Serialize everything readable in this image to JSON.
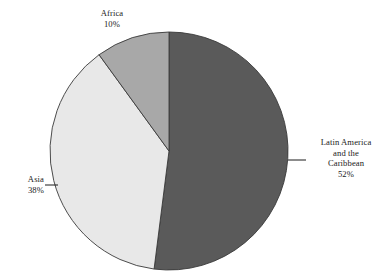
{
  "figure": {
    "background_color": "#ffffff",
    "width": 384,
    "height": 277
  },
  "chart_data": {
    "type": "pie",
    "title": "",
    "subtitle": "",
    "xlabel": "",
    "ylabel": "",
    "legend_position": "none",
    "grid": false,
    "start_angle_deg": 90,
    "direction": "clockwise",
    "units": "percent",
    "total": 100,
    "categories": [
      "Latin America and the Caribbean",
      "Asia",
      "Africa"
    ],
    "values": [
      52,
      38,
      10
    ],
    "colors": [
      "#5a5a5a",
      "#e8e8e8",
      "#a8a8a8"
    ],
    "slice_edge_color": "#3a3a3a",
    "slices": [
      {
        "name": "Latin America and the Caribbean",
        "value": 52,
        "value_label": "52%",
        "color": "#5a5a5a",
        "sweep_deg": 187.2
      },
      {
        "name": "Asia",
        "value": 38,
        "value_label": "38%",
        "color": "#e8e8e8",
        "sweep_deg": 136.8
      },
      {
        "name": "Africa",
        "value": 10,
        "value_label": "10%",
        "color": "#a8a8a8",
        "sweep_deg": 36.0
      }
    ]
  },
  "labels": {
    "africa": {
      "name": "Africa",
      "percent": "10%"
    },
    "asia": {
      "name": "Asia",
      "percent": "38%"
    },
    "latin_america": {
      "line1": "Latin America",
      "line2": "and the",
      "line3": "Caribbean",
      "percent": "52%"
    }
  },
  "leader_lines": {
    "color": "#1a1a1a",
    "asia": {
      "x1": 45,
      "y1": 185,
      "x2": 58,
      "y2": 185
    },
    "latin_america": {
      "x1": 288,
      "y1": 160,
      "x2": 306,
      "y2": 160
    }
  }
}
